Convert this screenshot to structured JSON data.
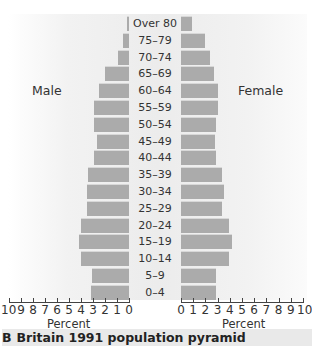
{
  "chart_data": {
    "type": "bar",
    "subtype": "population-pyramid",
    "title": "Britain 1991 population pyramid",
    "figure_label": "B",
    "categories": [
      "Over 80",
      "75–79",
      "70–74",
      "65–69",
      "60–64",
      "55–59",
      "50–54",
      "45–49",
      "40–44",
      "35–39",
      "30–34",
      "25–29",
      "20–24",
      "15–19",
      "10–14",
      "5–9",
      "0–4"
    ],
    "series": [
      {
        "name": "Male",
        "values": [
          0.2,
          0.5,
          0.9,
          2.0,
          2.5,
          2.9,
          2.9,
          2.7,
          2.9,
          3.4,
          3.5,
          3.5,
          4.0,
          4.2,
          4.0,
          3.1,
          3.2
        ]
      },
      {
        "name": "Female",
        "values": [
          0.9,
          2.0,
          2.4,
          2.7,
          3.0,
          3.0,
          2.9,
          2.8,
          2.9,
          3.4,
          3.5,
          3.4,
          3.9,
          4.2,
          3.9,
          2.9,
          2.9
        ]
      }
    ],
    "xlabel_left": "Percent",
    "xlabel_right": "Percent",
    "xlim": [
      0,
      10
    ],
    "x_ticks_left": [
      "10",
      "9",
      "8",
      "7",
      "6",
      "5",
      "4",
      "3",
      "2",
      "1",
      "0"
    ],
    "x_ticks_right": [
      "0",
      "1",
      "2",
      "3",
      "4",
      "5",
      "6",
      "7",
      "8",
      "9",
      "10"
    ],
    "grid": false,
    "bar_color": "#ababab"
  },
  "labels": {
    "male": "Male",
    "female": "Female",
    "percent_left": "Percent",
    "percent_right": "Percent",
    "caption_letter": "B",
    "caption_text": "Britain 1991 population pyramid"
  }
}
